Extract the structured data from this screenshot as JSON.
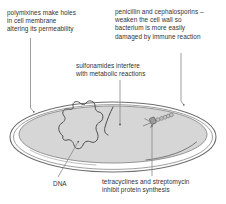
{
  "diagram": {
    "subject": "bacterium",
    "colors": {
      "background": "#ffffff",
      "cytoplasm": "#d6d6d6",
      "cell_wall_stroke": "#6f6f6f",
      "cell_membrane_stroke": "#8a8a8a",
      "leader_line": "#8d8d8d",
      "dna_stroke": "#4a4a4a",
      "text": "#333333",
      "ribosome_fill": "#b5b5b5"
    }
  },
  "labels": {
    "polymixines": {
      "text": "polymixines make holes\nin cell membrane\naltering its permeability",
      "target": "cell membrane"
    },
    "penicillin": {
      "text": "penicillin and cephalosporins –\nweaken the cell wall so\nbacterium is more easily\ndamaged by immune reaction",
      "target": "cell wall"
    },
    "sulfonamides": {
      "text": "sulfonamides interfere\nwith metabolic reactions",
      "target": "cytoplasm"
    },
    "tetracyclines": {
      "text": "tetracyclines and streptomycin\ninhibit protein synthesis",
      "target": "ribosome"
    },
    "dna": {
      "text": "DNA",
      "target": "dna-loop"
    }
  },
  "structures": {
    "cell_wall": "outer-ellipse",
    "cell_membrane": "inner-ellipse",
    "cytoplasm": "cytoplasm-fill",
    "dna_loop": "dna-loop",
    "plasmid": "plasmid-strand",
    "ribosome": "ribosome-on-mrna"
  }
}
